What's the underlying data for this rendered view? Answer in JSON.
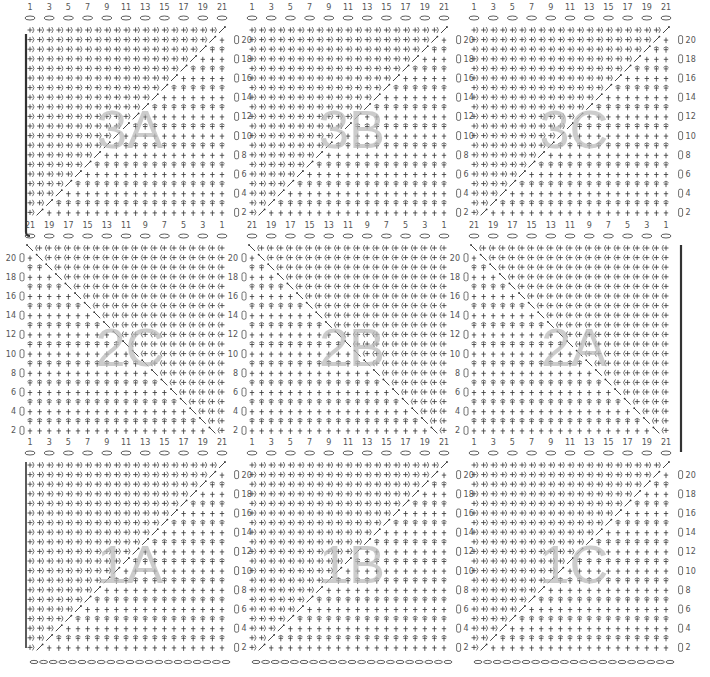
{
  "diagram": {
    "type": "crochet-chart",
    "background": "#ffffff",
    "ink_color": "#333333",
    "label_color": "#555555",
    "watermark_color": "#bbbbbb",
    "columns_per_panel": 21,
    "rows_per_panel": 20,
    "column_labels_ltr": [
      "1",
      "3",
      "5",
      "7",
      "9",
      "11",
      "13",
      "15",
      "17",
      "19",
      "21"
    ],
    "column_labels_rtl": [
      "21",
      "19",
      "17",
      "15",
      "13",
      "11",
      "9",
      "7",
      "5",
      "3",
      "1"
    ],
    "row_labels": [
      "20",
      "18",
      "16",
      "14",
      "12",
      "10",
      "8",
      "6",
      "4",
      "2"
    ],
    "stitch_symbols": {
      "row_forward": "+)",
      "row_backward": "(+",
      "column_stitch": "+",
      "column_cap": "⌒",
      "diagonal": "⤡",
      "foundation": "⬭"
    },
    "panels": [
      {
        "id": "3A",
        "label": "3A",
        "row": 0,
        "col": 0,
        "direction": "ltr",
        "row_numbers_side": "right",
        "diagonal": "up"
      },
      {
        "id": "3B",
        "label": "3B",
        "row": 0,
        "col": 1,
        "direction": "ltr",
        "row_numbers_side": "right",
        "diagonal": "up"
      },
      {
        "id": "3C",
        "label": "3C",
        "row": 0,
        "col": 2,
        "direction": "ltr",
        "row_numbers_side": "right",
        "diagonal": "up"
      },
      {
        "id": "2C",
        "label": "2C",
        "row": 1,
        "col": 0,
        "direction": "rtl",
        "row_numbers_side": "left",
        "diagonal": "down"
      },
      {
        "id": "2B",
        "label": "2B",
        "row": 1,
        "col": 1,
        "direction": "rtl",
        "row_numbers_side": "left",
        "diagonal": "down"
      },
      {
        "id": "2A",
        "label": "2A",
        "row": 1,
        "col": 2,
        "direction": "rtl",
        "row_numbers_side": "left",
        "diagonal": "down"
      },
      {
        "id": "1A",
        "label": "1A",
        "row": 2,
        "col": 0,
        "direction": "ltr",
        "row_numbers_side": "right",
        "diagonal": "up"
      },
      {
        "id": "1B",
        "label": "1B",
        "row": 2,
        "col": 1,
        "direction": "ltr",
        "row_numbers_side": "right",
        "diagonal": "up"
      },
      {
        "id": "1C",
        "label": "1C",
        "row": 2,
        "col": 2,
        "direction": "ltr",
        "row_numbers_side": "right",
        "diagonal": "up"
      }
    ]
  }
}
